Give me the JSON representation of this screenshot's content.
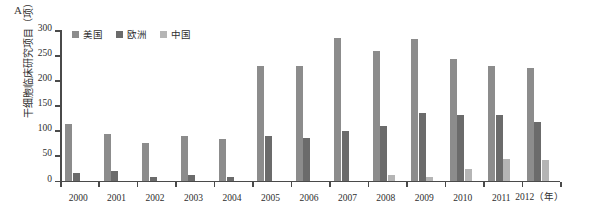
{
  "panel": {
    "letter": "A"
  },
  "legend": {
    "items": [
      {
        "label": "美国",
        "color": "#8c8c8c",
        "key": "us"
      },
      {
        "label": "欧洲",
        "color": "#6b6b6b",
        "key": "eu"
      },
      {
        "label": "中国",
        "color": "#b5b5b5",
        "key": "cn"
      }
    ]
  },
  "chart_data": {
    "type": "bar",
    "title": "",
    "xlabel": "(年)",
    "ylabel": "干细胞临床研究项目（项）",
    "categories": [
      "2000",
      "2001",
      "2002",
      "2003",
      "2004",
      "2005",
      "2006",
      "2007",
      "2008",
      "2009",
      "2010",
      "2011",
      "2012"
    ],
    "xtick_labels": [
      "2000",
      "2001",
      "2002",
      "2003",
      "2004",
      "2005",
      "2006",
      "2007",
      "2008",
      "2009",
      "2010",
      "2011",
      "2012（年）"
    ],
    "ylim": [
      0,
      300
    ],
    "yticks": [
      0,
      50,
      100,
      150,
      200,
      250,
      300
    ],
    "ytick_labels": [
      "0",
      "50",
      "100",
      "150",
      "200",
      "250",
      "300"
    ],
    "grid": false,
    "legend_position": "top-left",
    "series": [
      {
        "name": "美国",
        "color": "#8c8c8c",
        "values": [
          113,
          93,
          75,
          88,
          82,
          228,
          228,
          285,
          258,
          282,
          243,
          228,
          225
        ]
      },
      {
        "name": "欧洲",
        "color": "#6b6b6b",
        "values": [
          15,
          18,
          8,
          10,
          7,
          88,
          85,
          98,
          108,
          135,
          130,
          130,
          117
        ]
      },
      {
        "name": "中国",
        "color": "#b5b5b5",
        "values": [
          0,
          0,
          0,
          0,
          0,
          0,
          0,
          0,
          10,
          8,
          23,
          43,
          40
        ]
      }
    ]
  }
}
